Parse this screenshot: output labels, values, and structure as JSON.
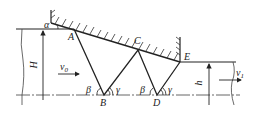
{
  "diagram": {
    "points": {
      "A": "A",
      "B": "B",
      "C": "C",
      "D": "D",
      "E": "E"
    },
    "angles": {
      "alpha": "α",
      "beta1": "β",
      "gamma1": "γ",
      "beta2": "β",
      "gamma2": "γ"
    },
    "dimensions": {
      "H": "H",
      "h": "h"
    },
    "velocities": {
      "v0": "v",
      "v0_sub": "0",
      "v1": "v",
      "v1_sub": "1"
    },
    "colors": {
      "line": "#222222",
      "ground": "#555555"
    }
  }
}
